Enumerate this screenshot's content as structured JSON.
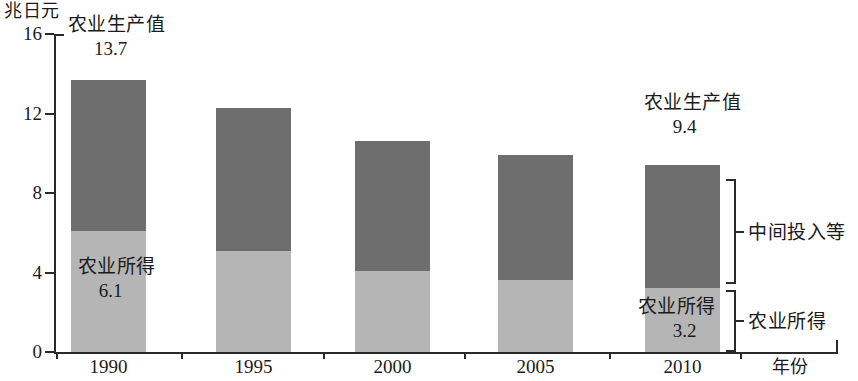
{
  "chart_data": {
    "type": "bar",
    "subtype": "stacked",
    "title": "",
    "xlabel": "年份",
    "ylabel": "兆日元",
    "categories": [
      "1990",
      "1995",
      "2000",
      "2005",
      "2010"
    ],
    "ylim": [
      0,
      16
    ],
    "yticks": [
      "0",
      "4",
      "8",
      "12",
      "16"
    ],
    "grid": false,
    "legend": "right-brackets",
    "series": [
      {
        "name": "农业所得",
        "color": "#b5b5b5",
        "values": [
          6.1,
          5.1,
          4.1,
          3.6,
          3.2
        ]
      },
      {
        "name": "中间投入等",
        "color": "#6e6e6e",
        "values": [
          7.6,
          7.2,
          6.5,
          6.3,
          6.2
        ]
      }
    ],
    "totals": [
      13.7,
      12.3,
      10.6,
      9.9,
      9.4
    ],
    "annotations": {
      "first_bar_total_label": "农业生产值",
      "first_bar_total_value": "13.7",
      "first_bar_income_label": "农业所得",
      "first_bar_income_value": "6.1",
      "last_bar_total_label": "农业生产值",
      "last_bar_total_value": "9.4",
      "last_bar_income_label": "农业所得",
      "last_bar_income_value": "3.2"
    },
    "brackets": [
      {
        "label": "中间投入等"
      },
      {
        "label": "农业所得"
      }
    ]
  }
}
